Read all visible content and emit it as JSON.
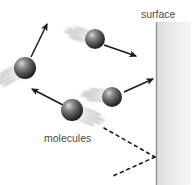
{
  "figure": {
    "background_color": "#ffffff",
    "width": 191,
    "height": 185,
    "labels": {
      "surface": "surface",
      "molecules": "molecules"
    },
    "label_color": "#4a4a4a",
    "surface": {
      "line_color": "#8c8c8c",
      "line_x": 156,
      "line_top": 22,
      "line_bottom": 185,
      "wall_fill_start": "#e2e2e2",
      "wall_fill_end": "#f4f4f4",
      "wall_width": 35
    },
    "molecules": [
      {
        "id": "molecule-upper-left",
        "cx": 25,
        "cy": 68,
        "r": 11,
        "blur_angle_deg": 135,
        "label": "rebounding molecule upper left"
      },
      {
        "id": "molecule-top-middle",
        "cx": 95,
        "cy": 39,
        "r": 10,
        "blur_angle_deg": 150,
        "label": "incoming molecule top middle"
      },
      {
        "id": "molecule-mid-right",
        "cx": 112,
        "cy": 97,
        "r": 10,
        "blur_angle_deg": 195,
        "label": "incoming molecule mid right"
      },
      {
        "id": "molecule-lower-left",
        "cx": 72,
        "cy": 110,
        "r": 11,
        "blur_angle_deg": 200,
        "label": "rebounding molecule lower left"
      }
    ],
    "sphere_colors": {
      "highlight": "#d8d8d8",
      "mid": "#6e6e6e",
      "shadow": "#2a2a2a",
      "edge": "#1b1b1b"
    },
    "arrows": [
      {
        "id": "arrow-up-right",
        "x1": 31,
        "y1": 57,
        "x2": 47,
        "y2": 23,
        "color": "#1b1b1b",
        "label": "velocity arrow up right"
      },
      {
        "id": "arrow-down-right",
        "x1": 104,
        "y1": 45,
        "x2": 137,
        "y2": 56,
        "color": "#1b1b1b",
        "label": "velocity arrow down right"
      },
      {
        "id": "arrow-to-surface",
        "x1": 124,
        "y1": 92,
        "x2": 154,
        "y2": 79,
        "color": "#1b1b1b",
        "label": "velocity arrow toward surface"
      },
      {
        "id": "arrow-up-left",
        "x1": 63,
        "y1": 105,
        "x2": 31,
        "y2": 89,
        "color": "#1b1b1b",
        "label": "velocity arrow up left"
      }
    ],
    "dashed_lines": [
      {
        "id": "dashed-incoming-ray",
        "x1": 104,
        "y1": 128,
        "x2": 155,
        "y2": 157,
        "color": "#1b1b1b",
        "dash": "3 4",
        "label": "dashed incoming trajectory"
      },
      {
        "id": "dashed-outgoing-ray",
        "x1": 155,
        "y1": 157,
        "x2": 113,
        "y2": 176,
        "color": "#1b1b1b",
        "dash": "3 4",
        "label": "dashed outgoing trajectory"
      }
    ],
    "label_positions": {
      "surface": {
        "x": 141,
        "y": 18,
        "anchor": "start"
      },
      "molecules": {
        "x": 44,
        "y": 142,
        "anchor": "start"
      }
    }
  }
}
